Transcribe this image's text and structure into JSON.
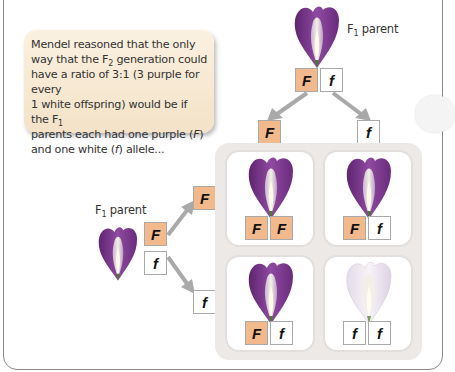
{
  "explanation": {
    "line1": "Mendel reasoned that the only",
    "line2_pre": "way that the F",
    "line2_sub": "2",
    "line2_post": " generation could",
    "line3": "have a ratio of 3:1 (3 purple for every",
    "line4_pre": "1 white offspring) would be if the F",
    "line4_sub": "1",
    "line5_pre": "parents each had one purple (",
    "line5_allele": "F",
    "line5_post": ")",
    "line6_pre": "and one white (",
    "line6_allele": "f",
    "line6_post": ") allele..."
  },
  "top_parent": {
    "label_pre": "F",
    "label_sub": "1",
    "label_post": " parent",
    "alleles": [
      "F",
      "f"
    ],
    "gametes": [
      "F",
      "f"
    ]
  },
  "left_parent": {
    "label_pre": "F",
    "label_sub": "1",
    "label_post": " parent",
    "alleles": [
      "F",
      "f"
    ],
    "gametes": [
      "F",
      "f"
    ]
  },
  "punnett": {
    "cells": [
      {
        "genotype": [
          "F",
          "F"
        ],
        "phenotype": "purple"
      },
      {
        "genotype": [
          "F",
          "f"
        ],
        "phenotype": "purple"
      },
      {
        "genotype": [
          "F",
          "f"
        ],
        "phenotype": "purple"
      },
      {
        "genotype": [
          "f",
          "f"
        ],
        "phenotype": "white"
      }
    ]
  },
  "colors": {
    "dominant_box": "#f2b98c",
    "recessive_box": "#ffffff",
    "arrow": "#a9a9a9",
    "purple_flower": "#7b3a8c",
    "white_flower": "#efe8f0",
    "textbox_bg": "#f6e8d2",
    "panel_bg": "#ece9e6"
  }
}
